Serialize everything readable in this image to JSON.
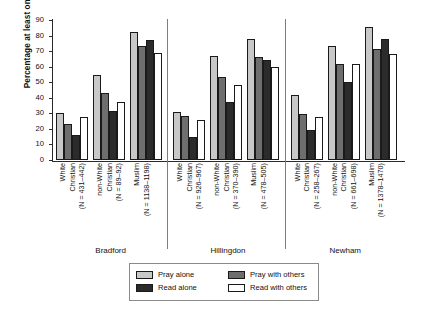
{
  "chart_data": {
    "type": "bar",
    "title": "",
    "xlabel": "",
    "ylabel": "Percentage at least once per week",
    "ylim": [
      0,
      90
    ],
    "yticks": [
      0,
      10,
      20,
      30,
      40,
      50,
      60,
      70,
      80,
      90
    ],
    "grid": false,
    "legend_position": "bottom",
    "series": [
      {
        "name": "Pray alone",
        "color": "#c8c8c8",
        "values": [
          30.5,
          54.5,
          82.5,
          31.0,
          67.0,
          78.0,
          41.5,
          73.5,
          85.5
        ]
      },
      {
        "name": "Pray with others",
        "color": "#6e6e6e",
        "values": [
          23.0,
          43.0,
          73.0,
          28.5,
          53.5,
          66.0,
          29.5,
          61.5,
          71.5
        ]
      },
      {
        "name": "Read alone",
        "color": "#2b2b2b",
        "values": [
          16.0,
          31.5,
          77.0,
          15.0,
          37.0,
          64.0,
          19.5,
          50.0,
          77.5
        ]
      },
      {
        "name": "Read with others",
        "color": "#ffffff",
        "values": [
          27.5,
          37.5,
          69.0,
          25.5,
          48.5,
          59.5,
          27.5,
          62.0,
          68.0
        ]
      }
    ],
    "groups": [
      {
        "town": "Bradford",
        "categories": [
          {
            "line1": "White",
            "line2": "Christian",
            "n": "(N = 431–442)"
          },
          {
            "line1": "non-White",
            "line2": "Christian",
            "n": "(N = 89–92)"
          },
          {
            "line1": "Muslim",
            "line2": "",
            "n": "(N = 1138–1198)"
          }
        ]
      },
      {
        "town": "Hillingdon",
        "categories": [
          {
            "line1": "White",
            "line2": "Christian",
            "n": "(N = 926–967)"
          },
          {
            "line1": "non-White",
            "line2": "Christian",
            "n": "(N = 370–390)"
          },
          {
            "line1": "Muslim",
            "line2": "",
            "n": "(N = 478–505)"
          }
        ]
      },
      {
        "town": "Newham",
        "categories": [
          {
            "line1": "White",
            "line2": "Christian",
            "n": "(N = 258–267)"
          },
          {
            "line1": "non-White",
            "line2": "Christian",
            "n": "(N = 661–698)"
          },
          {
            "line1": "Muslim",
            "line2": "",
            "n": "(N = 1378–1470)"
          }
        ]
      }
    ]
  }
}
